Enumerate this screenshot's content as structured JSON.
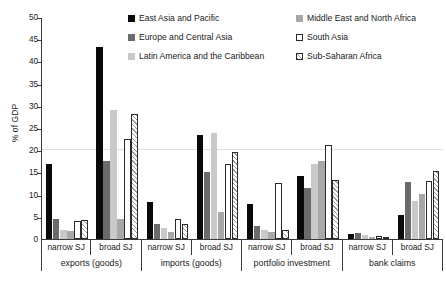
{
  "chart_data": {
    "type": "bar",
    "title": "",
    "xlabel": "",
    "ylabel": "% of GDP",
    "ylim": [
      0,
      50
    ],
    "yticks": [
      0,
      5,
      10,
      15,
      20,
      25,
      30,
      35,
      40,
      45,
      50
    ],
    "grid": "single faint horizontal gridline at y = 20",
    "legend_position": "top-center",
    "categories": [
      "narrow SJ exports (goods)",
      "broad SJ exports (goods)",
      "narrow SJ imports (goods)",
      "broad SJ imports (goods)",
      "narrow SJ portfolio investment",
      "broad SJ portfolio investment",
      "narrow SJ bank claims",
      "broad SJ bank claims"
    ],
    "group_pairs": [
      {
        "label": "exports (goods)",
        "subs": [
          "narrow SJ",
          "broad SJ"
        ]
      },
      {
        "label": "imports (goods)",
        "subs": [
          "narrow SJ",
          "broad SJ"
        ]
      },
      {
        "label": "portfolio investment",
        "subs": [
          "narrow SJ",
          "broad SJ"
        ]
      },
      {
        "label": "bank claims",
        "subs": [
          "narrow SJ",
          "broad SJ"
        ]
      }
    ],
    "series": [
      {
        "name": "East Asia and Pacific",
        "color": "#0a0a0a",
        "pattern": "solid",
        "values": [
          17.0,
          43.3,
          8.3,
          23.5,
          7.8,
          14.2,
          1.2,
          5.4
        ]
      },
      {
        "name": "Europe and Central Asia",
        "color": "#6b6b6b",
        "pattern": "solid",
        "values": [
          4.6,
          17.6,
          3.4,
          15.2,
          3.0,
          11.6,
          1.4,
          12.9
        ]
      },
      {
        "name": "Latin America and the Caribbean",
        "color": "#c9c9c9",
        "pattern": "solid",
        "values": [
          2.1,
          29.1,
          2.4,
          23.8,
          2.1,
          16.9,
          0.8,
          8.6
        ]
      },
      {
        "name": "Middle East and North Africa",
        "color": "#a8a8a8",
        "pattern": "solid",
        "values": [
          1.8,
          4.6,
          1.6,
          6.1,
          1.5,
          17.5,
          0.5,
          10.2
        ]
      },
      {
        "name": "South Asia",
        "color": "#ffffff",
        "pattern": "outline",
        "values": [
          4.1,
          22.6,
          4.4,
          16.8,
          12.7,
          21.2,
          0.6,
          13.1
        ]
      },
      {
        "name": "Sub-Saharan Africa",
        "color": "#ffffff",
        "pattern": "diagonal-hatch",
        "values": [
          4.2,
          28.1,
          3.4,
          19.5,
          2.0,
          13.3,
          0.5,
          15.4
        ]
      }
    ]
  },
  "axis": {
    "y_title": "% of GDP"
  },
  "legend": {
    "items": [
      {
        "label": "East Asia and Pacific",
        "swatch": "black-solid-swatch"
      },
      {
        "label": "Europe and Central Asia",
        "swatch": "dark-gray-solid-swatch"
      },
      {
        "label": "Latin America and the Caribbean",
        "swatch": "light-gray-solid-swatch"
      },
      {
        "label": "Middle East and North Africa",
        "swatch": "medium-gray-solid-swatch"
      },
      {
        "label": "South Asia",
        "swatch": "white-outline-swatch"
      },
      {
        "label": "Sub-Saharan Africa",
        "swatch": "hatched-swatch"
      }
    ]
  },
  "caption": ""
}
